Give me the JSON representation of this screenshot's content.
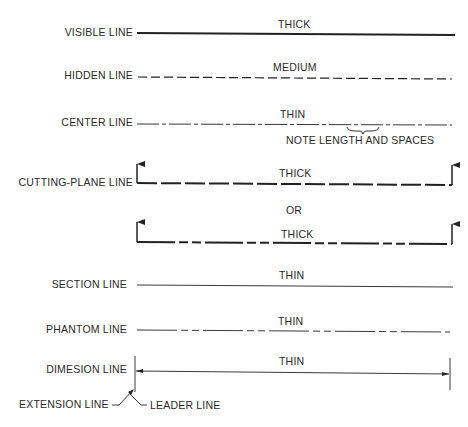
{
  "rows": {
    "visible": {
      "label": "VISIBLE LINE",
      "weight": "THICK"
    },
    "hidden": {
      "label": "HIDDEN LINE",
      "weight": "MEDIUM"
    },
    "center": {
      "label": "CENTER LINE",
      "weight": "THIN",
      "note": "NOTE LENGTH AND SPACES"
    },
    "cutting_plane": {
      "label": "CUTTING-PLANE LINE",
      "weight": "THICK",
      "or_label": "OR",
      "alt_weight": "THICK"
    },
    "section": {
      "label": "SECTION LINE",
      "weight": "THIN"
    },
    "phantom": {
      "label": "PHANTOM LINE",
      "weight": "THIN"
    },
    "dimension": {
      "label": "DIMESION LINE",
      "weight": "THIN"
    },
    "extension": {
      "label": "EXTENSION LINE"
    },
    "leader": {
      "label": "LEADER LINE"
    }
  },
  "colors": {
    "ink": "#222222",
    "background": "#ffffff"
  }
}
